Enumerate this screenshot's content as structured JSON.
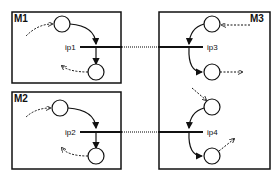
{
  "diagram": {
    "modules": [
      {
        "id": "M1",
        "label": "M1"
      },
      {
        "id": "M2",
        "label": "M2"
      },
      {
        "id": "M3",
        "label": "M3"
      }
    ],
    "interface_points": [
      {
        "id": "ip1",
        "label": "ip1",
        "module": "M1"
      },
      {
        "id": "ip2",
        "label": "ip2",
        "module": "M2"
      },
      {
        "id": "ip3",
        "label": "ip3",
        "module": "M3"
      },
      {
        "id": "ip4",
        "label": "ip4",
        "module": "M3"
      }
    ],
    "connections": [
      {
        "from": "ip1",
        "to": "ip3"
      },
      {
        "from": "ip2",
        "to": "ip4"
      }
    ],
    "colors": {
      "stroke": "#111111",
      "background": "#ffffff"
    }
  }
}
